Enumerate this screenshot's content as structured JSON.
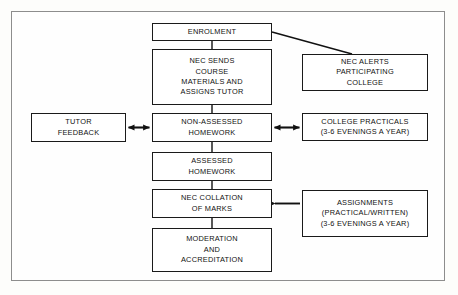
{
  "diagram": {
    "type": "flowchart",
    "frame_color": "#8d8d8d",
    "box_border_color": "#1a1a1a",
    "box_fill": "#ffffff",
    "background": "#fdfdfb",
    "nodes": [
      {
        "id": "enrolment",
        "name": "enrolment",
        "lines": [
          "ENROLMENT"
        ],
        "x": 152,
        "y": 23,
        "w": 120,
        "h": 18
      },
      {
        "id": "nec-sends",
        "name": "nec-sends-course-materials",
        "lines": [
          "NEC SENDS",
          "COURSE",
          "MATERIALS AND",
          "ASSIGNS TUTOR"
        ],
        "x": 152,
        "y": 49,
        "w": 120,
        "h": 56
      },
      {
        "id": "nec-alerts",
        "name": "nec-alerts-participating-college",
        "lines": [
          "NEC ALERTS",
          "PARTICIPATING",
          "COLLEGE"
        ],
        "x": 302,
        "y": 54,
        "w": 126,
        "h": 37
      },
      {
        "id": "tutor-feedback",
        "name": "tutor-feedback",
        "lines": [
          "TUTOR",
          "FEEDBACK"
        ],
        "x": 31,
        "y": 113,
        "w": 95,
        "h": 29
      },
      {
        "id": "non-assessed-homework",
        "name": "non-assessed-homework",
        "lines": [
          "NON-ASSESSED",
          "HOMEWORK"
        ],
        "x": 152,
        "y": 113,
        "w": 120,
        "h": 29
      },
      {
        "id": "college-practicals",
        "name": "college-practicals",
        "lines": [
          "COLLEGE PRACTICALS",
          "(3-6 EVENINGS A YEAR)"
        ],
        "x": 302,
        "y": 113,
        "w": 126,
        "h": 28
      },
      {
        "id": "assessed-homework",
        "name": "assessed-homework",
        "lines": [
          "ASSESSED",
          "HOMEWORK"
        ],
        "x": 152,
        "y": 152,
        "w": 120,
        "h": 29
      },
      {
        "id": "nec-collation",
        "name": "nec-collation-of-marks",
        "lines": [
          "NEC COLLATION",
          "OF MARKS"
        ],
        "x": 152,
        "y": 189,
        "w": 120,
        "h": 29
      },
      {
        "id": "assignments",
        "name": "assignments",
        "lines": [
          "ASSIGNMENTS",
          "(PRACTICAL/WRITTEN)",
          "(3-6 EVENINGS A YEAR)"
        ],
        "x": 302,
        "y": 190,
        "w": 126,
        "h": 47
      },
      {
        "id": "moderation",
        "name": "moderation-and-accreditation",
        "lines": [
          "MODERATION",
          "AND",
          "ACCREDITATION"
        ],
        "x": 152,
        "y": 228,
        "w": 120,
        "h": 44
      }
    ],
    "connectors": [
      {
        "name": "connector-enrolment-to-nec-sends",
        "kind": "plain-line",
        "from": "enrolment",
        "to": "nec-sends"
      },
      {
        "name": "connector-enrolment-to-nec-alerts",
        "kind": "diagonal-line",
        "from": "enrolment",
        "to": "nec-alerts"
      },
      {
        "name": "connector-nec-sends-to-non-assessed-homework",
        "kind": "plain-line",
        "from": "nec-sends",
        "to": "non-assessed-homework"
      },
      {
        "name": "connector-tutor-feedback-non-assessed-homework",
        "kind": "double-arrow",
        "from": "tutor-feedback",
        "to": "non-assessed-homework"
      },
      {
        "name": "connector-non-assessed-homework-college-practicals",
        "kind": "double-arrow",
        "from": "non-assessed-homework",
        "to": "college-practicals"
      },
      {
        "name": "connector-non-assessed-to-assessed-homework",
        "kind": "plain-line",
        "from": "non-assessed-homework",
        "to": "assessed-homework"
      },
      {
        "name": "connector-assessed-homework-to-nec-collation",
        "kind": "plain-line",
        "from": "assessed-homework",
        "to": "nec-collation"
      },
      {
        "name": "connector-assignments-to-nec-collation",
        "kind": "single-arrow-left",
        "from": "assignments",
        "to": "nec-collation"
      },
      {
        "name": "connector-nec-collation-to-moderation",
        "kind": "plain-line",
        "from": "nec-collation",
        "to": "moderation"
      }
    ]
  }
}
